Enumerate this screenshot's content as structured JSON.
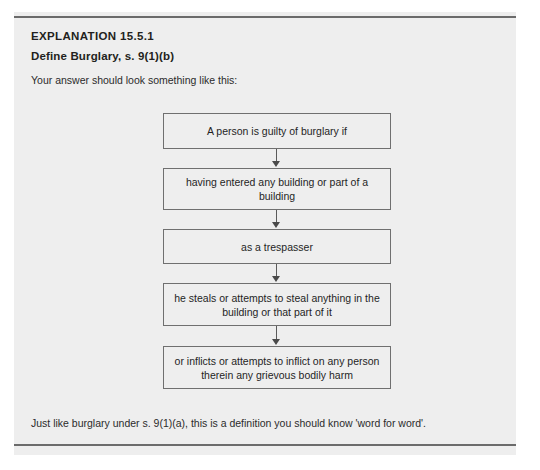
{
  "panel": {
    "title": "EXPLANATION 15.5.1",
    "subtitle": "Define Burglary, s. 9(1)(b)",
    "intro": "Your answer should look something like this:",
    "footer": "Just like burglary under s. 9(1)(a), this is a definition you should know 'word for word'.",
    "background_color": "#eeeeee",
    "rule_color": "#6b6b6b"
  },
  "flowchart": {
    "type": "vertical-flow",
    "box_border_color": "#6f6f6f",
    "connector_color": "#5a5a5a",
    "boxes": [
      {
        "label": "A person is guilty of burglary if"
      },
      {
        "label": "having entered any building or part of a building"
      },
      {
        "label": "as a trespasser"
      },
      {
        "label": "he steals or attempts to steal anything in the building or that part of it"
      },
      {
        "label": "or inflicts or attempts to inflict on any person therein any grievous bodily harm"
      }
    ]
  }
}
